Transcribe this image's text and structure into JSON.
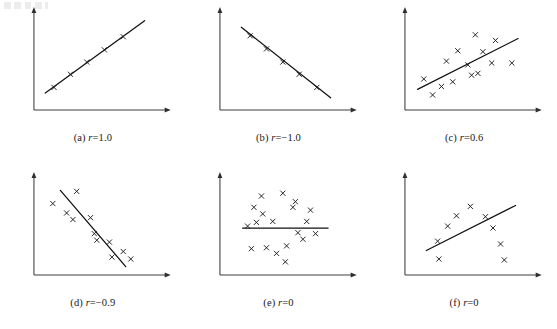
{
  "figure": {
    "title": "",
    "layout": {
      "rows": 2,
      "cols": 3
    },
    "axis_color": "#3c3c3c",
    "line_color": "#111111",
    "marker_color": "#1d1d1d",
    "marker_glyph": "x"
  },
  "panels": [
    {
      "id": "a",
      "label": "(a)",
      "r_symbol": "r",
      "r_text": "=1.0",
      "caption": "(a) r=1.0"
    },
    {
      "id": "b",
      "label": "(b)",
      "r_symbol": "r",
      "r_text": "=−1.0",
      "caption": "(b) r=−1.0"
    },
    {
      "id": "c",
      "label": "(c)",
      "r_symbol": "r",
      "r_text": "=0.6",
      "caption": "(c) r=0.6"
    },
    {
      "id": "d",
      "label": "(d)",
      "r_symbol": "r",
      "r_text": "=−0.9",
      "caption": "(d) r=−0.9"
    },
    {
      "id": "e",
      "label": "(e)",
      "r_symbol": "r",
      "r_text": "=0",
      "caption": "(e) r=0"
    },
    {
      "id": "f",
      "label": "(f)",
      "r_symbol": "r",
      "r_text": "=0",
      "caption": "(f) r=0"
    }
  ],
  "chart_data": [
    {
      "type": "scatter",
      "panel": "a",
      "title": "(a) r=1.0",
      "correlation": 1.0,
      "xlabel": "",
      "ylabel": "",
      "xlim": [
        0,
        100
      ],
      "ylim": [
        0,
        100
      ],
      "grid": false,
      "legend": "none",
      "points": [
        {
          "x": 16,
          "y": 24
        },
        {
          "x": 29,
          "y": 38
        },
        {
          "x": 42,
          "y": 51
        },
        {
          "x": 56,
          "y": 64
        },
        {
          "x": 71,
          "y": 78
        }
      ],
      "fit_line": {
        "x1": 9,
        "y1": 18,
        "x2": 88,
        "y2": 95
      }
    },
    {
      "type": "scatter",
      "panel": "b",
      "title": "(b) r=−1.0",
      "correlation": -1.0,
      "xlabel": "",
      "ylabel": "",
      "xlim": [
        0,
        100
      ],
      "ylim": [
        0,
        100
      ],
      "grid": false,
      "legend": "none",
      "points": [
        {
          "x": 24,
          "y": 79
        },
        {
          "x": 37,
          "y": 65
        },
        {
          "x": 50,
          "y": 51
        },
        {
          "x": 63,
          "y": 38
        },
        {
          "x": 77,
          "y": 24
        }
      ],
      "fit_line": {
        "x1": 17,
        "y1": 88,
        "x2": 88,
        "y2": 13
      }
    },
    {
      "type": "scatter",
      "panel": "c",
      "title": "(c) r=0.6",
      "correlation": 0.6,
      "xlabel": "",
      "ylabel": "",
      "xlim": [
        0,
        100
      ],
      "ylim": [
        0,
        100
      ],
      "grid": false,
      "legend": "none",
      "points": [
        {
          "x": 15,
          "y": 33
        },
        {
          "x": 22,
          "y": 16
        },
        {
          "x": 29,
          "y": 25
        },
        {
          "x": 33,
          "y": 52
        },
        {
          "x": 38,
          "y": 30
        },
        {
          "x": 42,
          "y": 63
        },
        {
          "x": 50,
          "y": 48
        },
        {
          "x": 53,
          "y": 37
        },
        {
          "x": 56,
          "y": 80
        },
        {
          "x": 58,
          "y": 39
        },
        {
          "x": 62,
          "y": 62
        },
        {
          "x": 69,
          "y": 50
        },
        {
          "x": 72,
          "y": 74
        },
        {
          "x": 85,
          "y": 50
        }
      ],
      "fit_line": {
        "x1": 10,
        "y1": 22,
        "x2": 90,
        "y2": 76
      }
    },
    {
      "type": "scatter",
      "panel": "d",
      "title": "(d) r=−0.9",
      "correlation": -0.9,
      "xlabel": "",
      "ylabel": "",
      "xlim": [
        0,
        100
      ],
      "ylim": [
        0,
        100
      ],
      "grid": false,
      "legend": "none",
      "points": [
        {
          "x": 15,
          "y": 76
        },
        {
          "x": 26,
          "y": 66
        },
        {
          "x": 31,
          "y": 59
        },
        {
          "x": 34,
          "y": 89
        },
        {
          "x": 45,
          "y": 61
        },
        {
          "x": 48,
          "y": 44
        },
        {
          "x": 50,
          "y": 37
        },
        {
          "x": 60,
          "y": 35
        },
        {
          "x": 62,
          "y": 19
        },
        {
          "x": 71,
          "y": 25
        },
        {
          "x": 77,
          "y": 17
        }
      ],
      "fit_line": {
        "x1": 21,
        "y1": 90,
        "x2": 73,
        "y2": 9
      }
    },
    {
      "type": "scatter",
      "panel": "e",
      "title": "(e) r=0",
      "correlation": 0,
      "xlabel": "",
      "ylabel": "",
      "xlim": [
        0,
        100
      ],
      "ylim": [
        0,
        100
      ],
      "grid": false,
      "legend": "none",
      "points": [
        {
          "x": 27,
          "y": 72
        },
        {
          "x": 33,
          "y": 84
        },
        {
          "x": 34,
          "y": 65
        },
        {
          "x": 29,
          "y": 56
        },
        {
          "x": 22,
          "y": 52
        },
        {
          "x": 37,
          "y": 29
        },
        {
          "x": 45,
          "y": 23
        },
        {
          "x": 42,
          "y": 57
        },
        {
          "x": 50,
          "y": 87
        },
        {
          "x": 53,
          "y": 31
        },
        {
          "x": 58,
          "y": 72
        },
        {
          "x": 60,
          "y": 78
        },
        {
          "x": 62,
          "y": 45
        },
        {
          "x": 66,
          "y": 38
        },
        {
          "x": 69,
          "y": 57
        },
        {
          "x": 72,
          "y": 69
        },
        {
          "x": 76,
          "y": 44
        },
        {
          "x": 52,
          "y": 14
        },
        {
          "x": 25,
          "y": 28
        }
      ],
      "fit_line": {
        "x1": 18,
        "y1": 50,
        "x2": 86,
        "y2": 50
      }
    },
    {
      "type": "scatter",
      "panel": "f",
      "title": "(f) r=0",
      "correlation": 0,
      "xlabel": "",
      "ylabel": "",
      "xlim": [
        0,
        100
      ],
      "ylim": [
        0,
        100
      ],
      "grid": false,
      "legend": "none",
      "points": [
        {
          "x": 26,
          "y": 36
        },
        {
          "x": 27,
          "y": 17
        },
        {
          "x": 34,
          "y": 52
        },
        {
          "x": 41,
          "y": 63
        },
        {
          "x": 52,
          "y": 73
        },
        {
          "x": 64,
          "y": 62
        },
        {
          "x": 70,
          "y": 50
        },
        {
          "x": 76,
          "y": 33
        },
        {
          "x": 79,
          "y": 16
        }
      ],
      "fit_line": {
        "x1": 17,
        "y1": 26,
        "x2": 88,
        "y2": 74
      }
    }
  ]
}
